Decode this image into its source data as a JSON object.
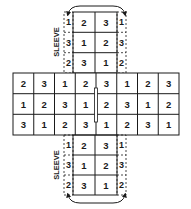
{
  "diagram": {
    "main_grid": {
      "rows": [
        [
          "2",
          "3",
          "1",
          "2",
          "3",
          "1",
          "2",
          "3"
        ],
        [
          "1",
          "2",
          "3",
          "1",
          "2",
          "3",
          "1",
          "2"
        ],
        [
          "3",
          "1",
          "2",
          "3",
          "1",
          "2",
          "3",
          "1"
        ]
      ]
    },
    "top_block": {
      "rows": [
        [
          "2",
          "3"
        ],
        [
          "1",
          "2"
        ],
        [
          "3",
          "1"
        ]
      ],
      "sleeve_left": [
        "1",
        "3",
        "2"
      ],
      "sleeve_right": [
        "1",
        "3",
        "2"
      ],
      "sleeve_label": "SLEEVE"
    },
    "bottom_block": {
      "rows": [
        [
          "2",
          "3"
        ],
        [
          "1",
          "2"
        ],
        [
          "3",
          "1"
        ]
      ],
      "sleeve_left": [
        "1",
        "3",
        "2"
      ],
      "sleeve_right": [
        "1",
        "3",
        "2"
      ],
      "sleeve_label": "SLEEVE"
    },
    "colors": {
      "line": "#1a1a1a",
      "background": "#ffffff"
    }
  }
}
